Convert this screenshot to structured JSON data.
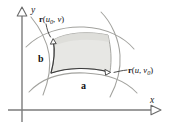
{
  "figure": {
    "type": "diagram",
    "background_color": "#ffffff",
    "axes": {
      "x_label": "x",
      "y_label": "y",
      "x_axis_name": "x-axis",
      "y_axis_name": "y-axis",
      "arrowhead_style": "hollow-triangle",
      "origin_px": [
        22,
        110
      ],
      "axis_color": "#6e6e6e"
    },
    "patch": {
      "name": "surface-patch",
      "fill_color": "#e7e7e4",
      "edge_color": "#8a8a86",
      "description": "curvilinear quadrilateral shaded light gray"
    },
    "grid_curves": {
      "color": "#9a9a96",
      "count": 4,
      "description": "two u-constant and two v-constant curves extending beyond the patch"
    },
    "labels": {
      "curve_u0": {
        "name": "label-r-u0-v",
        "r": "r",
        "open": "(",
        "var1": "u",
        "sub1": "0",
        "comma": ", ",
        "var2": "v",
        "close": ")",
        "full_text": "r(u0, v)"
      },
      "curve_v0": {
        "name": "label-r-u-v0",
        "r": "r",
        "open": "(",
        "var1": "u",
        "comma": ", ",
        "var2": "v",
        "sub2": "0",
        "close": ")",
        "full_text": "r(u, v0)"
      },
      "vector_a": "a",
      "vector_b": "b"
    }
  }
}
